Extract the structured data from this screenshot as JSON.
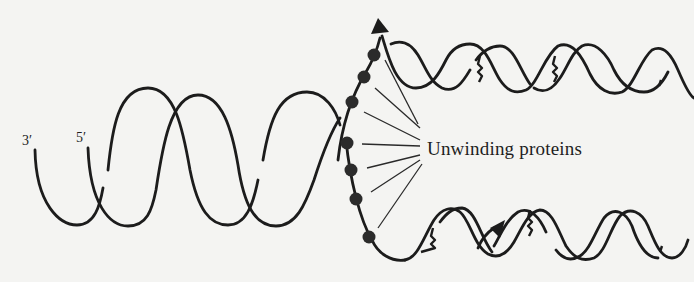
{
  "figure": {
    "labels": {
      "three_prime": "3′",
      "five_prime": "5′",
      "unwinding_proteins": "Unwinding proteins"
    },
    "colors": {
      "background": "#f4f4f2",
      "ink": "#1c1c1c"
    },
    "protein_count": 7,
    "pointer_line_count": 7,
    "parts": [
      "parental double helix (left)",
      "replication fork with unwinding proteins",
      "upper daughter helix with new strand",
      "lower daughter helix with new strand"
    ]
  }
}
